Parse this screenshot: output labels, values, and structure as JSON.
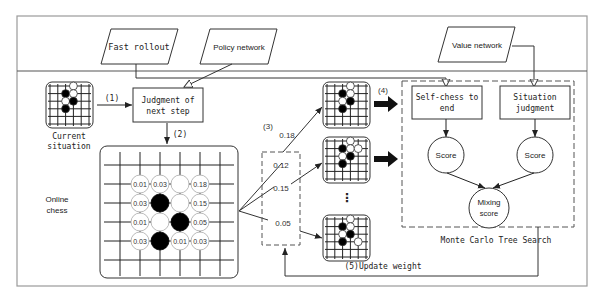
{
  "inputs": {
    "fast_rollout": "Fast rollout",
    "policy_network": "Policy network",
    "value_network": "Value network"
  },
  "current_situation": {
    "label_line1": "Current",
    "label_line2": "situation"
  },
  "judgment": {
    "line1": "Judgment of",
    "line2": "next step"
  },
  "steps": {
    "s1": "(1)",
    "s2": "(2)",
    "s3": "(3)",
    "s4": "(4)",
    "s5": "(5)Update weight"
  },
  "online_chess": {
    "line1": "Online",
    "line2": "chess"
  },
  "board_probs": [
    {
      "row": 0,
      "col": 0,
      "text": "0.01"
    },
    {
      "row": 0,
      "col": 1,
      "text": "0.03"
    },
    {
      "row": 0,
      "col": 3,
      "text": "0.18"
    },
    {
      "row": 1,
      "col": 0,
      "text": "0.03"
    },
    {
      "row": 1,
      "col": 3,
      "text": "0.15"
    },
    {
      "row": 2,
      "col": 0,
      "text": "0.01"
    },
    {
      "row": 2,
      "col": 3,
      "text": "0.05"
    },
    {
      "row": 3,
      "col": 0,
      "text": "0.03"
    },
    {
      "row": 3,
      "col": 2,
      "text": "0.01"
    },
    {
      "row": 3,
      "col": 3,
      "text": "0.03"
    }
  ],
  "board_stones": [
    {
      "row": 0,
      "col": 2,
      "color": "white"
    },
    {
      "row": 1,
      "col": 1,
      "color": "black"
    },
    {
      "row": 1,
      "col": 2,
      "color": "white"
    },
    {
      "row": 2,
      "col": 1,
      "color": "white"
    },
    {
      "row": 2,
      "col": 2,
      "color": "black"
    },
    {
      "row": 3,
      "col": 1,
      "color": "black"
    }
  ],
  "candidates": {
    "p1": "0.18",
    "p2": "0.12",
    "p3": "0.15",
    "p4": "0.05",
    "ellipsis": "⋮"
  },
  "mcts": {
    "title": "Monte Carlo Tree Search",
    "self_chess_line1": "Self-chess to",
    "self_chess_line2": "end",
    "situation_line1": "Situation",
    "situation_line2": "judgment",
    "score_left": "Score",
    "score_right": "Score",
    "mixing_line1": "Mixing",
    "mixing_line2": "score"
  },
  "colors": {
    "line": "#333333",
    "frame": "#888888",
    "text": "#222222"
  }
}
